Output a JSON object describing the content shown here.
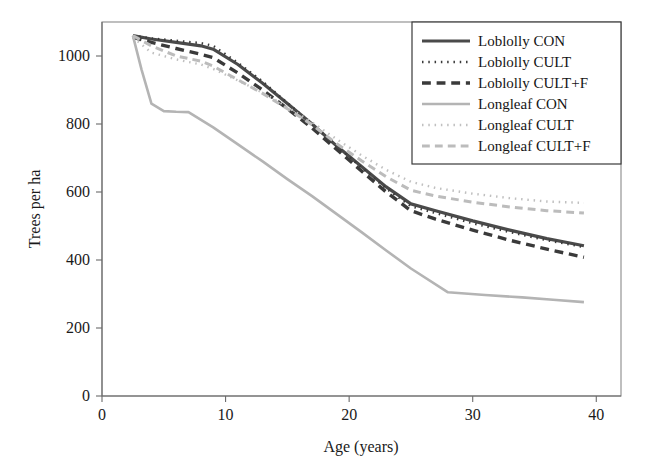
{
  "chart_data": {
    "type": "line",
    "title": "",
    "xlabel": "Age (years)",
    "ylabel": "Trees per ha",
    "xlim": [
      0,
      42
    ],
    "ylim": [
      0,
      1100
    ],
    "xticks": [
      0,
      10,
      20,
      30,
      40
    ],
    "yticks": [
      0,
      200,
      400,
      600,
      800,
      1000
    ],
    "grid": false,
    "legend_position": "upper right",
    "series": [
      {
        "name": "Loblolly CON",
        "style": "solid",
        "color": "#4a4a4a",
        "width": 3.2,
        "x": [
          2.5,
          4,
          6,
          8,
          9,
          11,
          13,
          15,
          17,
          19,
          21,
          23,
          25,
          27,
          30,
          33,
          36,
          39
        ],
        "y": [
          1060,
          1050,
          1040,
          1030,
          1020,
          975,
          920,
          860,
          800,
          735,
          675,
          615,
          565,
          545,
          515,
          488,
          463,
          442
        ]
      },
      {
        "name": "Loblolly CULT",
        "style": "dotted",
        "color": "#3a3a3a",
        "width": 2.4,
        "x": [
          2.5,
          4,
          6,
          8,
          9,
          11,
          13,
          15,
          17,
          19,
          21,
          23,
          25,
          27,
          30,
          33,
          36,
          39
        ],
        "y": [
          1060,
          1052,
          1045,
          1038,
          1030,
          980,
          925,
          862,
          800,
          735,
          672,
          610,
          558,
          538,
          508,
          482,
          458,
          438
        ]
      },
      {
        "name": "Loblolly CULT+F",
        "style": "dashed",
        "color": "#3a3a3a",
        "width": 3.4,
        "x": [
          2.5,
          4,
          6,
          8,
          9,
          11,
          13,
          15,
          17,
          19,
          21,
          23,
          25,
          27,
          30,
          33,
          36,
          39
        ],
        "y": [
          1055,
          1040,
          1022,
          1005,
          995,
          950,
          900,
          845,
          788,
          725,
          662,
          600,
          545,
          520,
          488,
          458,
          432,
          408
        ]
      },
      {
        "name": "Longleaf CON",
        "style": "solid",
        "color": "#b4b4b4",
        "width": 2.6,
        "x": [
          2.5,
          3.2,
          4,
          5,
          6,
          7,
          9,
          11,
          13,
          15,
          17,
          19,
          21,
          23,
          25,
          28,
          31,
          34,
          36.5,
          39
        ],
        "y": [
          1060,
          960,
          860,
          838,
          836,
          835,
          790,
          740,
          690,
          638,
          588,
          535,
          482,
          428,
          375,
          305,
          297,
          290,
          283,
          276
        ]
      },
      {
        "name": "Longleaf CULT",
        "style": "dotted",
        "color": "#c0c0c0",
        "width": 2.4,
        "x": [
          2.5,
          4,
          6,
          8,
          9,
          11,
          13,
          15,
          17,
          19,
          21,
          23,
          25,
          27,
          30,
          33,
          36,
          39
        ],
        "y": [
          1055,
          1010,
          990,
          975,
          962,
          928,
          892,
          850,
          805,
          755,
          708,
          665,
          630,
          612,
          595,
          582,
          572,
          568
        ]
      },
      {
        "name": "Longleaf CULT+F",
        "style": "dashed",
        "color": "#bcbcbc",
        "width": 3.0,
        "x": [
          2.5,
          4,
          6,
          8,
          9,
          11,
          13,
          15,
          17,
          19,
          21,
          23,
          25,
          27,
          30,
          33,
          36,
          39
        ],
        "y": [
          1060,
          1030,
          1000,
          985,
          970,
          930,
          890,
          845,
          798,
          742,
          692,
          645,
          605,
          588,
          570,
          556,
          545,
          538
        ]
      }
    ]
  },
  "axis": {
    "x_label": "Age (years)",
    "y_label": "Trees per ha",
    "x_tick_labels": [
      "0",
      "10",
      "20",
      "30",
      "40"
    ],
    "y_tick_labels": [
      "0",
      "200",
      "400",
      "600",
      "800",
      "1000"
    ]
  },
  "legend": {
    "entries": [
      {
        "label": "Loblolly CON"
      },
      {
        "label": "Loblolly CULT"
      },
      {
        "label": "Loblolly CULT+F"
      },
      {
        "label": "Longleaf CON"
      },
      {
        "label": "Longleaf CULT"
      },
      {
        "label": "Longleaf CULT+F"
      }
    ]
  }
}
